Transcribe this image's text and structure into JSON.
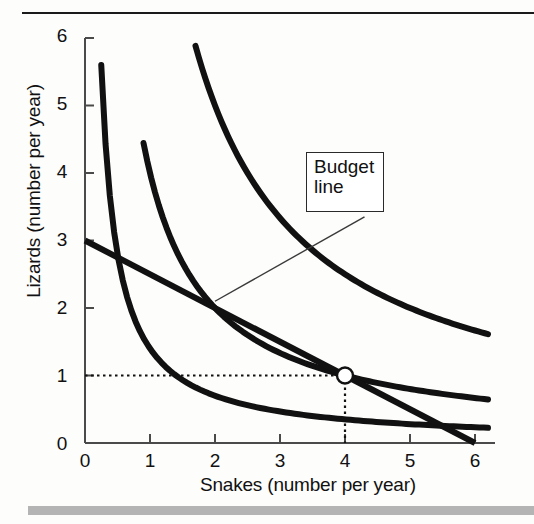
{
  "figure": {
    "xlabel": "Snakes (number per year)",
    "ylabel": "Lizards (number per year)",
    "annotation_label_line1": "Budget",
    "annotation_label_line2": "line"
  },
  "axis": {
    "x_ticks": [
      "0",
      "1",
      "2",
      "3",
      "4",
      "5",
      "6"
    ],
    "y_ticks": [
      "0",
      "1",
      "2",
      "3",
      "4",
      "5",
      "6"
    ]
  },
  "chart_data": {
    "type": "line",
    "title": "",
    "xlabel": "Snakes (number per year)",
    "ylabel": "Lizards (number per year)",
    "xlim": [
      0,
      6.3
    ],
    "ylim": [
      0,
      6.3
    ],
    "xticks": [
      0,
      1,
      2,
      3,
      4,
      5,
      6
    ],
    "yticks": [
      0,
      1,
      2,
      3,
      4,
      5,
      6
    ],
    "grid": false,
    "legend": "none",
    "series": [
      {
        "name": "Budget line",
        "kind": "budget-line",
        "x": [
          0,
          6
        ],
        "y": [
          3,
          0
        ],
        "intercepts": {
          "y_intercept": 3,
          "x_intercept": 6
        },
        "slope": -0.5,
        "linewidth_px": 6
      },
      {
        "name": "Indifference curve I1",
        "kind": "indifference-curve",
        "utility_xy_product": 1.4,
        "x": [
          0.25,
          0.4,
          0.6,
          0.9,
          1.3,
          1.8,
          2.4,
          3.0,
          3.6,
          4.2,
          4.8,
          5.4,
          6.2
        ],
        "y": [
          5.6,
          3.5,
          2.33,
          1.56,
          1.08,
          0.78,
          0.58,
          0.47,
          0.39,
          0.33,
          0.29,
          0.26,
          0.23
        ],
        "linewidth_px": 6
      },
      {
        "name": "Indifference curve I2",
        "kind": "indifference-curve",
        "utility_xy_product": 4.0,
        "x": [
          0.9,
          1.2,
          1.6,
          2.0,
          2.6,
          3.2,
          4.0,
          4.6,
          5.2,
          5.7,
          6.2
        ],
        "y": [
          5.8,
          4.4,
          3.25,
          2.5,
          1.85,
          1.47,
          1.0,
          0.87,
          0.77,
          0.7,
          0.5
        ],
        "linewidth_px": 6
      },
      {
        "name": "Indifference curve I3",
        "kind": "indifference-curve",
        "utility_xy_product": 10.0,
        "x": [
          1.7,
          2.1,
          2.6,
          3.1,
          3.7,
          4.3,
          4.9,
          5.5,
          6.2
        ],
        "y": [
          5.8,
          4.75,
          3.85,
          3.23,
          2.7,
          2.32,
          2.04,
          1.82,
          1.6
        ],
        "linewidth_px": 6
      }
    ],
    "points": [
      {
        "name": "best-affordable-point",
        "x": 4,
        "y": 1,
        "marker": "open-circle",
        "facecolor": "#ffffff",
        "edgecolor": "#111111",
        "guide_lines": "dotted to both axes"
      }
    ],
    "annotations": [
      {
        "text": "Budget line",
        "box": true,
        "leader_from": [
          2.0,
          2.1
        ],
        "leader_to": [
          4.3,
          3.35
        ]
      }
    ]
  },
  "colors": {
    "curve": "#111111",
    "axis": "#4a4a4a",
    "rule": "#1a1a1a",
    "bottom_bar": "#b4b4b4",
    "marker_fill": "#ffffff",
    "text": "#111111"
  }
}
